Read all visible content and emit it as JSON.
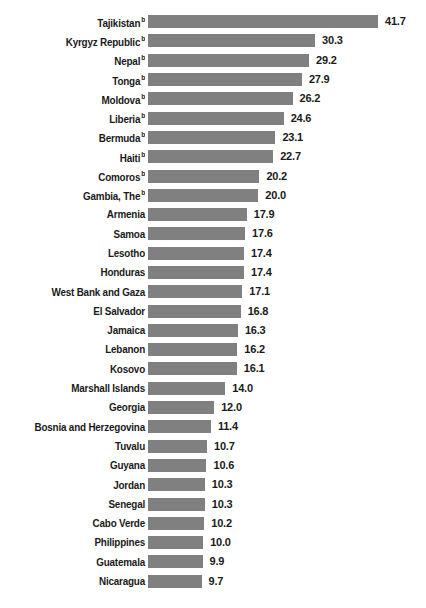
{
  "chart_data": {
    "type": "bar",
    "orientation": "horizontal",
    "title": "",
    "subtitle": "",
    "xlabel": "",
    "ylabel": "",
    "grid": false,
    "legend": null,
    "axis_visible": false,
    "value_labels_shown": true,
    "value_label_format": "0.0",
    "xlim": [
      0,
      41.7
    ],
    "bar_color": "#808080",
    "text_color": "#1a1a1a",
    "background_color": "#ffffff",
    "footnote_marker": "b",
    "categories": [
      "Tajikistan",
      "Kyrgyz Republic",
      "Nepal",
      "Tonga",
      "Moldova",
      "Liberia",
      "Bermuda",
      "Haiti",
      "Comoros",
      "Gambia, The",
      "Armenia",
      "Samoa",
      "Lesotho",
      "Honduras",
      "West Bank and Gaza",
      "El Salvador",
      "Jamaica",
      "Lebanon",
      "Kosovo",
      "Marshall Islands",
      "Georgia",
      "Bosnia and Herzegovina",
      "Tuvalu",
      "Guyana",
      "Jordan",
      "Senegal",
      "Cabo Verde",
      "Philippines",
      "Guatemala",
      "Nicaragua"
    ],
    "values": [
      41.7,
      30.3,
      29.2,
      27.9,
      26.2,
      24.6,
      23.1,
      22.7,
      20.2,
      20.0,
      17.9,
      17.6,
      17.4,
      17.4,
      17.1,
      16.8,
      16.3,
      16.2,
      16.1,
      14.0,
      12.0,
      11.4,
      10.7,
      10.6,
      10.3,
      10.3,
      10.2,
      10.0,
      9.9,
      9.7
    ],
    "rows": [
      {
        "label": "Tajikistan",
        "marker": "b",
        "value": 41.7,
        "value_text": "41.7"
      },
      {
        "label": "Kyrgyz Republic",
        "marker": "b",
        "value": 30.3,
        "value_text": "30.3"
      },
      {
        "label": "Nepal",
        "marker": "b",
        "value": 29.2,
        "value_text": "29.2"
      },
      {
        "label": "Tonga",
        "marker": "b",
        "value": 27.9,
        "value_text": "27.9"
      },
      {
        "label": "Moldova",
        "marker": "b",
        "value": 26.2,
        "value_text": "26.2"
      },
      {
        "label": "Liberia",
        "marker": "b",
        "value": 24.6,
        "value_text": "24.6"
      },
      {
        "label": "Bermuda",
        "marker": "b",
        "value": 23.1,
        "value_text": "23.1"
      },
      {
        "label": "Haiti",
        "marker": "b",
        "value": 22.7,
        "value_text": "22.7"
      },
      {
        "label": "Comoros",
        "marker": "b",
        "value": 20.2,
        "value_text": "20.2"
      },
      {
        "label": "Gambia, The",
        "marker": "b",
        "value": 20.0,
        "value_text": "20.0"
      },
      {
        "label": "Armenia",
        "marker": "",
        "value": 17.9,
        "value_text": "17.9"
      },
      {
        "label": "Samoa",
        "marker": "",
        "value": 17.6,
        "value_text": "17.6"
      },
      {
        "label": "Lesotho",
        "marker": "",
        "value": 17.4,
        "value_text": "17.4"
      },
      {
        "label": "Honduras",
        "marker": "",
        "value": 17.4,
        "value_text": "17.4"
      },
      {
        "label": "West Bank and Gaza",
        "marker": "",
        "value": 17.1,
        "value_text": "17.1"
      },
      {
        "label": "El Salvador",
        "marker": "",
        "value": 16.8,
        "value_text": "16.8"
      },
      {
        "label": "Jamaica",
        "marker": "",
        "value": 16.3,
        "value_text": "16.3"
      },
      {
        "label": "Lebanon",
        "marker": "",
        "value": 16.2,
        "value_text": "16.2"
      },
      {
        "label": "Kosovo",
        "marker": "",
        "value": 16.1,
        "value_text": "16.1"
      },
      {
        "label": "Marshall Islands",
        "marker": "",
        "value": 14.0,
        "value_text": "14.0"
      },
      {
        "label": "Georgia",
        "marker": "",
        "value": 12.0,
        "value_text": "12.0"
      },
      {
        "label": "Bosnia and Herzegovina",
        "marker": "",
        "value": 11.4,
        "value_text": "11.4"
      },
      {
        "label": "Tuvalu",
        "marker": "",
        "value": 10.7,
        "value_text": "10.7"
      },
      {
        "label": "Guyana",
        "marker": "",
        "value": 10.6,
        "value_text": "10.6"
      },
      {
        "label": "Jordan",
        "marker": "",
        "value": 10.3,
        "value_text": "10.3"
      },
      {
        "label": "Senegal",
        "marker": "",
        "value": 10.3,
        "value_text": "10.3"
      },
      {
        "label": "Cabo Verde",
        "marker": "",
        "value": 10.2,
        "value_text": "10.2"
      },
      {
        "label": "Philippines",
        "marker": "",
        "value": 10.0,
        "value_text": "10.0"
      },
      {
        "label": "Guatemala",
        "marker": "",
        "value": 9.9,
        "value_text": "9.9"
      },
      {
        "label": "Nicaragua",
        "marker": "",
        "value": 9.7,
        "value_text": "9.7"
      }
    ]
  }
}
